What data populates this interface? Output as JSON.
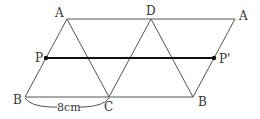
{
  "diagram": {
    "points": {
      "A1": {
        "label": "A",
        "x": 67,
        "y": 19
      },
      "D": {
        "label": "D",
        "x": 151,
        "y": 19
      },
      "A2": {
        "label": "A",
        "x": 235,
        "y": 19
      },
      "P": {
        "label": "P",
        "x": 46,
        "y": 58
      },
      "P2": {
        "label": "P'",
        "x": 214,
        "y": 58
      },
      "B1": {
        "label": "B",
        "x": 25,
        "y": 97
      },
      "C": {
        "label": "C",
        "x": 109,
        "y": 97
      },
      "B2": {
        "label": "B",
        "x": 193,
        "y": 97
      }
    },
    "measure": {
      "label": "8cm"
    }
  }
}
